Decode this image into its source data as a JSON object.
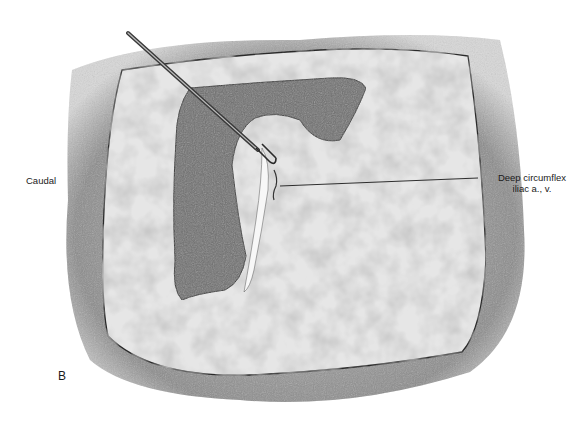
{
  "figure": {
    "panel_letter": "B",
    "orientation_label": "Caudal",
    "callouts": [
      {
        "line1": "Deep circumflex",
        "line2": "iliac a., v."
      }
    ],
    "colors": {
      "background": "#ffffff",
      "surrounding_tissue": "#8a8a8a",
      "muscle_surface": "#d9d9d9",
      "retracted_flap": "#6e6e6e",
      "outline": "#2a2a2a",
      "instrument": "#4a4a4a",
      "text": "#1a1a1a"
    }
  }
}
